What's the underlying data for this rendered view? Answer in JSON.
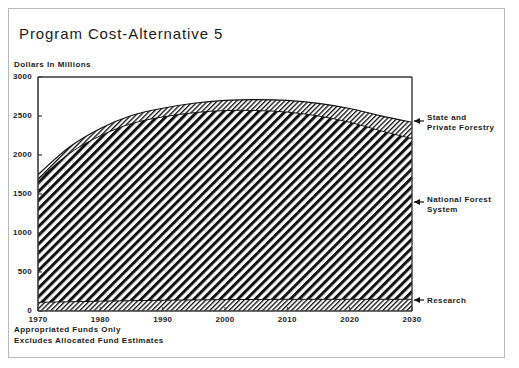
{
  "title": "Program Cost-Alternative 5",
  "y_axis_caption": "Dollars In Millions",
  "footnotes": [
    "Appropriated Funds Only",
    "Excludes Allocated Fund Estimates"
  ],
  "callouts": {
    "state_private_forestry": "State and\nPrivate Forestry",
    "national_forest_system": "National Forest\nSystem",
    "research": "Research"
  },
  "colors": {
    "ink": "#1b1b1b",
    "frame": "#b9b9b9",
    "axis": "#3a3a3a",
    "hatch": "#111111",
    "background": "#ffffff"
  },
  "chart_data": {
    "type": "area",
    "title": "Program Cost-Alternative 5",
    "xlabel": "",
    "ylabel": "Dollars In Millions",
    "xlim": [
      1970,
      2030
    ],
    "ylim": [
      0,
      3000
    ],
    "xticks": [
      1970,
      1980,
      1990,
      2000,
      2010,
      2020,
      2030
    ],
    "yticks": [
      0,
      500,
      1000,
      1500,
      2000,
      2500,
      3000
    ],
    "grid": false,
    "stacked": true,
    "legend_position": "right-callouts",
    "x": [
      1970,
      1975,
      1980,
      1985,
      1990,
      1995,
      2000,
      2005,
      2010,
      2015,
      2020,
      2025,
      2030
    ],
    "series": [
      {
        "name": "Research",
        "hatch": "fine-diagonal",
        "values": [
          110,
          118,
          126,
          132,
          138,
          142,
          146,
          148,
          150,
          150,
          150,
          150,
          150
        ]
      },
      {
        "name": "National Forest System",
        "hatch": "bold-diagonal",
        "values": [
          1570,
          1900,
          2120,
          2270,
          2350,
          2400,
          2424,
          2422,
          2400,
          2350,
          2270,
          2160,
          2060
        ]
      },
      {
        "name": "State and Private Forestry",
        "hatch": "fine-diagonal",
        "values": [
          70,
          82,
          94,
          104,
          112,
          122,
          130,
          140,
          150,
          162,
          176,
          192,
          210
        ]
      }
    ],
    "totals": [
      1750,
      2100,
      2340,
      2506,
      2600,
      2664,
      2700,
      2710,
      2700,
      2662,
      2596,
      2502,
      2420
    ],
    "nfs_tops": [
      1680,
      2018,
      2246,
      2402,
      2488,
      2542,
      2570,
      2570,
      2550,
      2500,
      2420,
      2310,
      2210
    ]
  }
}
